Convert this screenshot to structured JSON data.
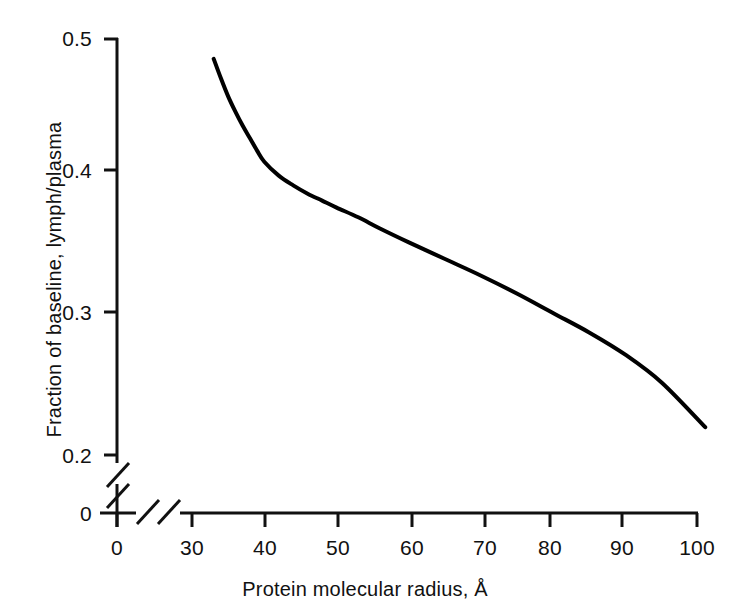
{
  "chart_data": {
    "type": "line",
    "title": "",
    "subtitle": "",
    "xlabel": "Protein molecular radius, Å",
    "ylabel": "Fraction of baseline, lymph/plasma",
    "xlim": [
      30,
      101
    ],
    "ylim": [
      0.2,
      0.5
    ],
    "grid": false,
    "legend": null,
    "x_axis_break": {
      "present": true,
      "between": [
        0,
        30
      ],
      "symbol": "double-slash"
    },
    "y_axis_break": {
      "present": true,
      "between": [
        0,
        0.2
      ],
      "symbol": "double-slash"
    },
    "xticks": [
      0,
      30,
      40,
      50,
      60,
      70,
      80,
      90,
      100
    ],
    "xtick_labels": [
      "0",
      "30",
      "40",
      "50",
      "60",
      "70",
      "80",
      "90",
      "100"
    ],
    "yticks": [
      0,
      0.2,
      0.3,
      0.4,
      0.5
    ],
    "ytick_labels": [
      "0",
      "0.2",
      "0.3",
      "0.4",
      "0.5"
    ],
    "series": [
      {
        "name": "lymph/plasma fraction",
        "color": "#000000",
        "linewidth": 4,
        "x": [
          33,
          34,
          35,
          36,
          37,
          38,
          39,
          40,
          42,
          44,
          46,
          48,
          50,
          53,
          56,
          60,
          65,
          70,
          75,
          80,
          85,
          90,
          95,
          101
        ],
        "y": [
          0.485,
          0.471,
          0.458,
          0.447,
          0.437,
          0.428,
          0.419,
          0.411,
          0.401,
          0.394,
          0.388,
          0.383,
          0.378,
          0.371,
          0.363,
          0.353,
          0.341,
          0.329,
          0.316,
          0.302,
          0.288,
          0.272,
          0.252,
          0.22
        ]
      }
    ]
  },
  "axes": {
    "x_title": "Protein molecular radius, Å",
    "y_title": "Fraction of baseline, lymph/plasma",
    "y_labels": {
      "t05": "0.5",
      "t04": "0.4",
      "t03": "0.3",
      "t02": "0.2",
      "t00": "0"
    },
    "x_labels": {
      "t0": "0",
      "t30": "30",
      "t40": "40",
      "t50": "50",
      "t60": "60",
      "t70": "70",
      "t80": "80",
      "t90": "90",
      "t100": "100"
    }
  },
  "colors": {
    "background": "#ffffff",
    "axis": "#111111",
    "curve": "#000000",
    "text": "#111111"
  }
}
